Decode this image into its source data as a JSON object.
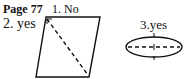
{
  "page_label": "Page 77",
  "answers": [
    {
      "number": "1.",
      "text": "No",
      "label": "1. No"
    },
    {
      "number": "2.",
      "text": "yes",
      "label": "2. yes"
    },
    {
      "number": "3.",
      "text": "yes",
      "label": "3.yes"
    }
  ],
  "figures": {
    "parallelogram": {
      "shape": "parallelogram",
      "line": "dashed diagonal",
      "note": "line of symmetry check"
    },
    "ellipse": {
      "shape": "ellipse",
      "line": "dashed horizontal axis with vertical tick",
      "note": "line of symmetry"
    }
  }
}
